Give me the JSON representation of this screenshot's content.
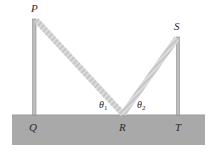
{
  "diagram": {
    "points": {
      "P": "P",
      "Q": "Q",
      "R": "R",
      "S": "S",
      "T": "T"
    },
    "angles": {
      "theta1": "θ",
      "theta1_sub": "1",
      "theta2": "θ",
      "theta2_sub": "2"
    },
    "colors": {
      "ground": "#a9a9a9",
      "post": "#b8b8b8",
      "post_edge": "#8c8c8c",
      "rope": "#d9d9d9",
      "rope_hatch": "#c4c4c4",
      "text": "#2a2a2a"
    }
  }
}
